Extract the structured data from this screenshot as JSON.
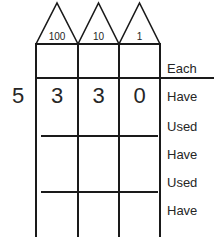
{
  "worksheet": {
    "title": "Place value subtraction worksheet",
    "multiplier": "5",
    "place_columns": [
      {
        "name": "hundreds",
        "roof_label": "100",
        "digit": "3"
      },
      {
        "name": "tens",
        "roof_label": "10",
        "digit": "3"
      },
      {
        "name": "ones",
        "roof_label": "1",
        "digit": "0"
      }
    ],
    "row_labels": [
      {
        "key": "each",
        "label": "Each"
      },
      {
        "key": "have-1",
        "label": "Have"
      },
      {
        "key": "used-1",
        "label": "Used"
      },
      {
        "key": "have-2",
        "label": "Have"
      },
      {
        "key": "used-2",
        "label": "Used"
      },
      {
        "key": "have-3",
        "label": "Have"
      }
    ],
    "colors": {
      "ink": "#1a1a1a",
      "text": "#262626",
      "paper": "#ffffff"
    }
  }
}
